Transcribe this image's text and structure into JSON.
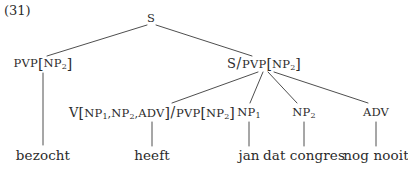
{
  "figure": {
    "example_number": "(31)",
    "kind": "syntax-tree",
    "language": "Dutch",
    "ink_color": "#2b2b2b",
    "background_color": "#ffffff"
  },
  "nodes": {
    "root": {
      "label": "S",
      "x": 151,
      "y": 19
    },
    "pvp": {
      "label": "PVP[NP2]",
      "parts": {
        "cat": "PVP",
        "open": "[",
        "inner": "NP",
        "sub": "2",
        "close": "]"
      },
      "x": 43,
      "y": 64
    },
    "s_pvp": {
      "label": "S/PVP[NP2]",
      "parts": {
        "num": "S",
        "slash": "/",
        "cat": "PVP",
        "open": "[",
        "inner": "NP",
        "sub": "2",
        "close": "]"
      },
      "x": 264,
      "y": 64
    },
    "verb_cat": {
      "label": "V[NP1,NP2,ADV]/PVP[NP2]",
      "parts": {
        "v": "V",
        "open": "[",
        "a1": "NP",
        "a1sub": "1",
        "c1": ",",
        "a2": "NP",
        "a2sub": "2",
        "c2": ",",
        "a3": "ADV",
        "close": "]",
        "slash": "/",
        "res": "PVP",
        "ropen": "[",
        "rinner": "NP",
        "rsub": "2",
        "rclose": "]"
      },
      "x": 152,
      "y": 113
    },
    "np1": {
      "label": "NP1",
      "parts": {
        "cat": "NP",
        "sub": "1"
      },
      "x": 249,
      "y": 113
    },
    "np2": {
      "label": "NP2",
      "parts": {
        "cat": "NP",
        "sub": "2"
      },
      "x": 304,
      "y": 113
    },
    "adv": {
      "label": "ADV",
      "parts": {
        "cat": "ADV"
      },
      "x": 376,
      "y": 113
    }
  },
  "terminals": {
    "bezocht": {
      "text": "bezocht",
      "x": 43,
      "y": 156
    },
    "heeft": {
      "text": "heeft",
      "x": 152,
      "y": 156
    },
    "jan": {
      "text": "jan",
      "x": 249,
      "y": 156
    },
    "dat_congres": {
      "text": "dat congres",
      "x": 304,
      "y": 156
    },
    "nog_nooit": {
      "text": "nog nooit",
      "x": 376,
      "y": 156
    }
  },
  "edges": [
    {
      "name": "root-to-pvp",
      "x1": 147,
      "y1": 25,
      "x2": 47,
      "y2": 56
    },
    {
      "name": "root-to-s-pvp",
      "x1": 156,
      "y1": 25,
      "x2": 252,
      "y2": 56
    },
    {
      "name": "s-pvp-to-verb",
      "x1": 258,
      "y1": 72,
      "x2": 172,
      "y2": 103
    },
    {
      "name": "s-pvp-to-np1",
      "x1": 263,
      "y1": 72,
      "x2": 250,
      "y2": 103
    },
    {
      "name": "s-pvp-to-np2",
      "x1": 268,
      "y1": 72,
      "x2": 297,
      "y2": 103
    },
    {
      "name": "s-pvp-to-adv",
      "x1": 274,
      "y1": 72,
      "x2": 368,
      "y2": 103
    },
    {
      "name": "pvp-to-bezocht",
      "x1": 43,
      "y1": 73,
      "x2": 43,
      "y2": 145
    },
    {
      "name": "verb-to-heeft",
      "x1": 152,
      "y1": 122,
      "x2": 152,
      "y2": 146
    },
    {
      "name": "np1-to-jan",
      "x1": 249,
      "y1": 122,
      "x2": 249,
      "y2": 146
    },
    {
      "name": "np2-to-dat-congres",
      "x1": 304,
      "y1": 122,
      "x2": 304,
      "y2": 146
    },
    {
      "name": "adv-to-nog-nooit",
      "x1": 376,
      "y1": 122,
      "x2": 376,
      "y2": 146
    }
  ]
}
